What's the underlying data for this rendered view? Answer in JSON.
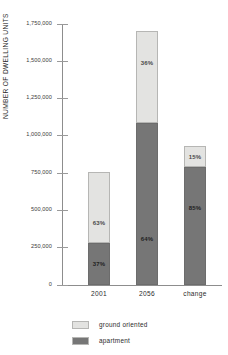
{
  "chart_data": {
    "type": "bar",
    "subtype": "stacked-percentage",
    "title": "",
    "xlabel": "",
    "ylabel": "NUMBER OF DWELLING UNITS",
    "ylim": [
      0,
      1750000
    ],
    "grid": false,
    "legend_position": "bottom",
    "categories": [
      "2001",
      "2056",
      "change"
    ],
    "ytick_labels": [
      "1,750,000",
      "1,500,000",
      "1,250,000",
      "1,000,000",
      "750,000",
      "500,000",
      "250,000",
      "0"
    ],
    "ytick_values": [
      1750000,
      1500000,
      1250000,
      1000000,
      750000,
      500000,
      250000,
      0
    ],
    "series": [
      {
        "name": "ground oriented",
        "color": "#e3e3e1",
        "values": [
          479000,
          612000,
          140000
        ],
        "percent_labels": [
          "63%",
          "36%",
          "15%"
        ]
      },
      {
        "name": "apartment",
        "color": "#767676",
        "values": [
          281000,
          1088000,
          790000
        ],
        "percent_labels": [
          "37%",
          "64%",
          "85%"
        ]
      }
    ],
    "totals": [
      760000,
      1700000,
      930000
    ]
  },
  "axis": {
    "y_title": "NUMBER OF DWELLING UNITS"
  },
  "legend": {
    "items": [
      {
        "label": "ground oriented",
        "color": "#e3e3e1"
      },
      {
        "label": "apartment",
        "color": "#767676"
      }
    ]
  }
}
